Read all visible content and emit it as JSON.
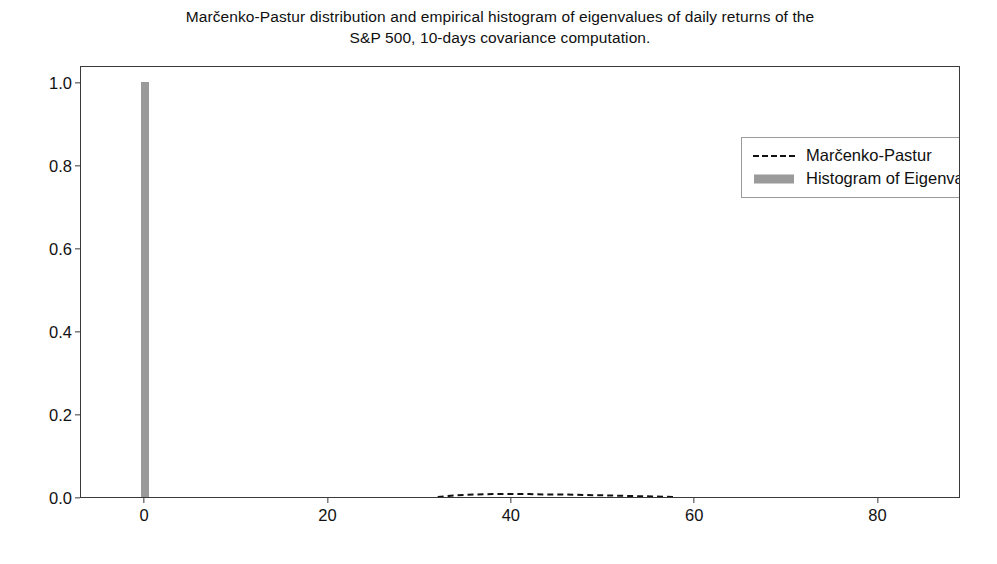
{
  "chart_data": {
    "type": "bar",
    "title": "Marčenko-Pastur distribution and empirical histogram of eigenvalues of daily returns of the S&P 500, 10-days covariance computation.",
    "title_lines": [
      "Marčenko-Pastur distribution and empirical histogram of eigenvalues of daily returns of the",
      "S&P 500, 10-days covariance computation."
    ],
    "xlabel": "",
    "ylabel": "",
    "xlim": [
      -7,
      89
    ],
    "ylim": [
      0.0,
      1.04
    ],
    "xticks": [
      0,
      20,
      40,
      60,
      80
    ],
    "xticklabels": [
      "0",
      "20",
      "40",
      "60",
      "80"
    ],
    "yticks": [
      0.0,
      0.2,
      0.4,
      0.6,
      0.8,
      1.0
    ],
    "yticklabels": [
      "0.0",
      "0.2",
      "0.4",
      "0.6",
      "0.8",
      "1.0"
    ],
    "grid": false,
    "legend_position": "upper right",
    "legend": [
      {
        "label": "Marčenko-Pastur",
        "key": "dashed-line",
        "color": "#111111"
      },
      {
        "label": "Histogram of Eigenvalues",
        "key": "patch",
        "color": "#9a9a9a"
      }
    ],
    "series": [
      {
        "name": "Histogram of Eigenvalues",
        "type": "bar",
        "color": "#9a9a9a",
        "bar_width": 0.9,
        "x": [
          0.0
        ],
        "values": [
          1.0
        ]
      },
      {
        "name": "Marčenko-Pastur",
        "type": "line",
        "color": "#111111",
        "linestyle": "dashed",
        "x": [
          32.0,
          34.0,
          36.0,
          38.0,
          40.0,
          42.0,
          44.0,
          46.0,
          48.0,
          50.0,
          52.0,
          54.0,
          56.0,
          58.0
        ],
        "values": [
          0.0,
          0.004,
          0.006,
          0.007,
          0.007,
          0.007,
          0.006,
          0.006,
          0.005,
          0.004,
          0.003,
          0.002,
          0.001,
          0.0
        ]
      }
    ],
    "colors": {
      "histogram": "#9a9a9a",
      "mp_line": "#111111",
      "axes_frame": "#3a3a3a",
      "background": "#ffffff",
      "text": "#101010"
    }
  }
}
